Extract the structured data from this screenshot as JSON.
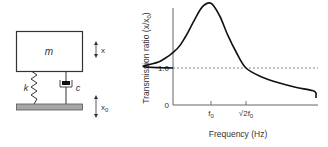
{
  "system": {
    "mass_label": "m",
    "spring_label": "k",
    "damper_label": "c",
    "mass_displacement_label": "x",
    "base_displacement_label": "x",
    "base_displacement_sub": "0"
  },
  "chart_data": {
    "type": "line",
    "title": "",
    "xlabel": "Frequency (Hz)",
    "ylabel": "Transmission ratio (x/x",
    "ylabel_sub": "0",
    "ylabel_close": ")",
    "y_ticks": [
      {
        "value": 0,
        "label": "0"
      },
      {
        "value": 1.0,
        "label": "1.0"
      }
    ],
    "x_ticks": [
      {
        "value": 1.0,
        "label": "f",
        "sub": "0"
      },
      {
        "value": 1.414,
        "label": "√2f",
        "sub": "0"
      }
    ],
    "x_unit": "frequency ratio f/f0",
    "xlim": [
      0,
      2.9
    ],
    "ylim": [
      0,
      2.9
    ],
    "reference_line": {
      "value": 1.0,
      "style": "dashed"
    },
    "series": [
      {
        "name": "transmissibility",
        "x": [
          0,
          0.2,
          0.4,
          0.6,
          0.7,
          0.8,
          0.9,
          1.0,
          1.1,
          1.2,
          1.3,
          1.414,
          1.6,
          1.8,
          2.0,
          2.2,
          2.4,
          2.6,
          2.9
        ],
        "y": [
          1.0,
          1.04,
          1.18,
          1.52,
          1.85,
          2.28,
          2.66,
          2.75,
          2.42,
          1.88,
          1.42,
          1.0,
          0.76,
          0.6,
          0.48,
          0.39,
          0.32,
          0.26,
          0.19
        ]
      }
    ],
    "grid": false,
    "legend": "none"
  }
}
